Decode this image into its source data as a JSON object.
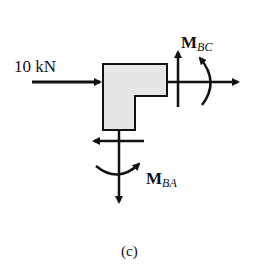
{
  "diagram": {
    "type": "free-body-diagram",
    "force_label": "10 kN",
    "moment_bc": {
      "main": "M",
      "sub": "BC"
    },
    "moment_ba": {
      "main": "M",
      "sub": "BA"
    },
    "caption": "(c)",
    "colors": {
      "stroke": "#111111",
      "fill": "#e6e6e6",
      "background": "#ffffff"
    }
  }
}
